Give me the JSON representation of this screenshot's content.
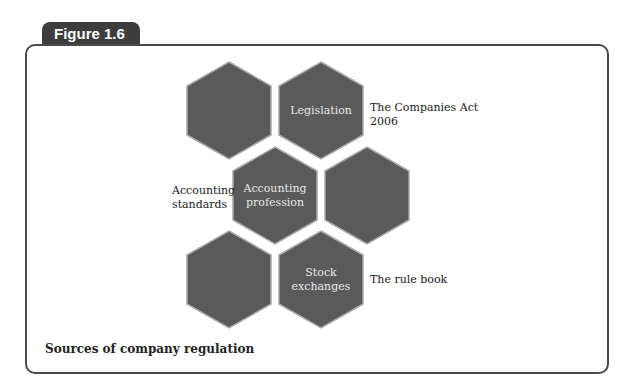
{
  "figure": {
    "label": "Figure 1.6",
    "caption": "Sources of company regulation"
  },
  "colors": {
    "hex_fill": "#5a5a5a",
    "hex_edge": "#9a9a9a",
    "tab_bg": "#3d3d3d",
    "frame_border": "#4a4a4a"
  },
  "hexagons": [
    {
      "id": "top-left",
      "label": ""
    },
    {
      "id": "top-right",
      "label": "Legislation"
    },
    {
      "id": "middle-left",
      "label": "Accounting profession"
    },
    {
      "id": "middle-right",
      "label": ""
    },
    {
      "id": "bottom-left",
      "label": ""
    },
    {
      "id": "bottom-right",
      "label": "Stock exchanges"
    }
  ],
  "annotations": {
    "legislation": "The Companies Act 2006",
    "accounting": "Accounting standards",
    "stock": "The rule book"
  }
}
